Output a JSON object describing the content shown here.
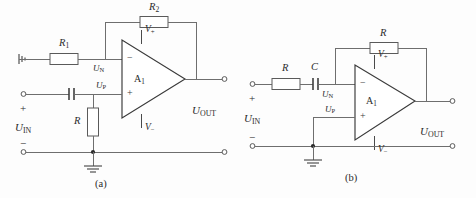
{
  "figure": {
    "background_color": "#fdfdfd",
    "wire_color": "#6e6e6e",
    "label_color": "#2b2b2b",
    "captions": [
      {
        "id": "a",
        "text": "(a)"
      },
      {
        "id": "b",
        "text": "(b)"
      }
    ]
  },
  "circuit_a": {
    "caption": "(a)",
    "components": [
      {
        "name": "input-resistor",
        "label": "R",
        "subscript": "1",
        "orientation": "horizontal"
      },
      {
        "name": "feedback-resistor",
        "label": "R",
        "subscript": "2",
        "orientation": "horizontal"
      },
      {
        "name": "shunt-resistor",
        "label": "R",
        "subscript": "",
        "orientation": "vertical"
      },
      {
        "name": "coupling-capacitor",
        "label": "",
        "subscript": "",
        "orientation": "horizontal"
      }
    ],
    "opamp": {
      "name": "A",
      "subscript": "1",
      "designator": "A₁",
      "inverting_pin": "−",
      "noninverting_pin": "+",
      "supply_positive": "V",
      "supply_positive_sub": "+",
      "supply_negative": "V",
      "supply_negative_sub": "−"
    },
    "nodes": [
      {
        "name": "inverting-node",
        "label": "U",
        "subscript": "N"
      },
      {
        "name": "noninverting-node",
        "label": "U",
        "subscript": "P"
      }
    ],
    "ports": {
      "input_label": "U",
      "input_subscript": "IN",
      "input_plus": "+",
      "input_minus": "−",
      "output_label": "U",
      "output_subscript": "OUT"
    },
    "ground_symbols": [
      "left-chassis-ground",
      "bottom-ground"
    ]
  },
  "circuit_b": {
    "caption": "(b)",
    "components": [
      {
        "name": "input-resistor",
        "label": "R",
        "subscript": "",
        "orientation": "horizontal"
      },
      {
        "name": "coupling-capacitor",
        "label": "C",
        "subscript": "",
        "orientation": "horizontal"
      },
      {
        "name": "feedback-resistor",
        "label": "R",
        "subscript": "",
        "orientation": "horizontal"
      }
    ],
    "opamp": {
      "name": "A",
      "subscript": "1",
      "designator": "A₁",
      "inverting_pin": "−",
      "noninverting_pin": "+",
      "supply_positive": "V",
      "supply_positive_sub": "+",
      "supply_negative": "V",
      "supply_negative_sub": "−"
    },
    "nodes": [
      {
        "name": "inverting-node",
        "label": "U",
        "subscript": "N"
      },
      {
        "name": "noninverting-node",
        "label": "U",
        "subscript": "P"
      }
    ],
    "ports": {
      "input_label": "U",
      "input_subscript": "IN",
      "input_plus": "+",
      "input_minus": "−",
      "output_label": "U",
      "output_subscript": "OUT"
    },
    "ground_symbols": [
      "bottom-ground"
    ]
  }
}
